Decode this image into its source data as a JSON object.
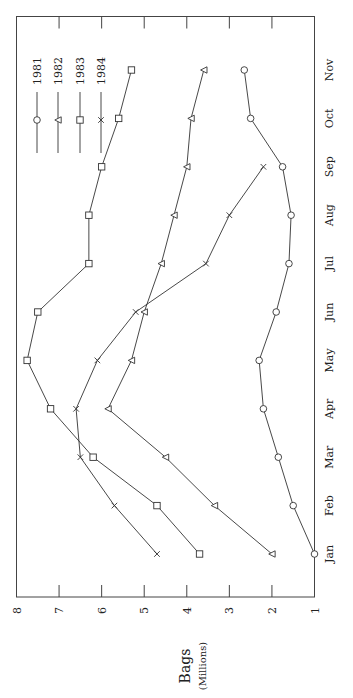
{
  "chart_data": {
    "type": "line",
    "orientation": "rotated-90-ccw",
    "title": "",
    "xlabel": "",
    "ylabel": "Bags",
    "ylabel_sub": "(Millions)",
    "categories": [
      "Jan",
      "Feb",
      "Mar",
      "Apr",
      "May",
      "Jun",
      "Jul",
      "Aug",
      "Sep",
      "Oct",
      "Nov"
    ],
    "ylim": [
      1,
      8
    ],
    "yticks": [
      8,
      7,
      6,
      5,
      4,
      3,
      2,
      1
    ],
    "grid": false,
    "legend_position": "top-left",
    "series": [
      {
        "name": "1981",
        "marker": "circle",
        "values": [
          1.0,
          1.5,
          1.85,
          2.2,
          2.3,
          1.9,
          1.6,
          1.55,
          1.75,
          2.5,
          2.65
        ]
      },
      {
        "name": "1982",
        "marker": "triangle",
        "values": [
          2.0,
          3.35,
          4.5,
          5.85,
          5.3,
          5.0,
          4.6,
          4.3,
          4.0,
          3.9,
          3.6
        ]
      },
      {
        "name": "1983",
        "marker": "square",
        "values": [
          3.7,
          4.7,
          6.2,
          7.2,
          7.75,
          7.5,
          6.3,
          6.3,
          6.0,
          5.6,
          5.3
        ]
      },
      {
        "name": "1984",
        "marker": "x",
        "values": [
          4.7,
          5.7,
          6.5,
          6.6,
          6.1,
          5.2,
          3.55,
          3.0,
          2.2,
          null,
          null
        ]
      }
    ]
  }
}
